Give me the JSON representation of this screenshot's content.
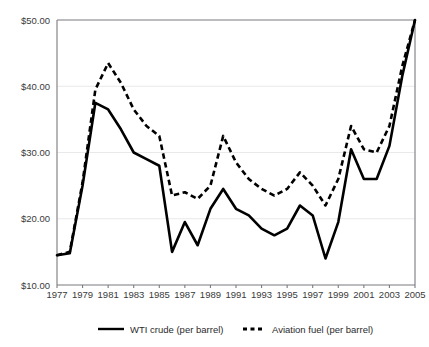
{
  "chart_data": {
    "type": "line",
    "title": "",
    "subtitle": "",
    "xlabel": "",
    "ylabel": "",
    "xlim": [
      1977,
      2005
    ],
    "ylim": [
      10,
      50
    ],
    "grid": true,
    "legend_position": "bottom-center",
    "y_tick_labels": [
      "$50.00",
      "$40.00",
      "$30.00",
      "$20.00",
      "$10.00"
    ],
    "y_tick_values": [
      50,
      40,
      30,
      20,
      10
    ],
    "x_tick_labels": [
      "1977",
      "1979",
      "1981",
      "1983",
      "1985",
      "1987",
      "1989",
      "1991",
      "1993",
      "1995",
      "1997",
      "1999",
      "2001",
      "2003",
      "2005"
    ],
    "x_tick_values": [
      1977,
      1979,
      1981,
      1983,
      1985,
      1987,
      1989,
      1991,
      1993,
      1995,
      1997,
      1999,
      2001,
      2003,
      2005
    ],
    "x": [
      1977,
      1978,
      1979,
      1980,
      1981,
      1982,
      1983,
      1984,
      1985,
      1986,
      1987,
      1988,
      1989,
      1990,
      1991,
      1992,
      1993,
      1994,
      1995,
      1996,
      1997,
      1998,
      1999,
      2000,
      2001,
      2002,
      2003,
      2004,
      2005
    ],
    "series": [
      {
        "name": "WTI crude (per barrel)",
        "style": "solid",
        "color": "#000000",
        "values": [
          14.5,
          14.8,
          25.0,
          37.5,
          36.5,
          33.5,
          30.0,
          29.0,
          28.0,
          15.0,
          19.5,
          16.0,
          21.5,
          24.5,
          21.5,
          20.5,
          18.5,
          17.5,
          18.5,
          22.0,
          20.5,
          14.0,
          19.5,
          30.5,
          26.0,
          26.0,
          31.0,
          41.5,
          50.0
        ]
      },
      {
        "name": "Aviation fuel (per barrel)",
        "style": "dashed",
        "color": "#000000",
        "values": [
          14.5,
          15.0,
          25.5,
          39.5,
          43.5,
          40.5,
          36.5,
          34.0,
          32.5,
          23.5,
          24.0,
          23.0,
          25.0,
          32.5,
          28.5,
          26.0,
          24.5,
          23.5,
          24.5,
          27.0,
          25.0,
          22.0,
          26.0,
          34.0,
          30.5,
          30.0,
          34.0,
          43.0,
          50.0
        ]
      }
    ]
  },
  "legend": {
    "items": [
      {
        "label": "WTI crude (per barrel)",
        "style": "solid"
      },
      {
        "label": "Aviation fuel (per barrel)",
        "style": "dashed"
      }
    ]
  }
}
